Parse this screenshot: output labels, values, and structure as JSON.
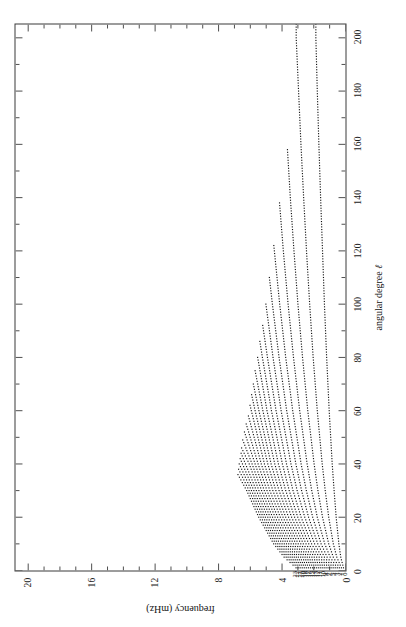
{
  "figure": {
    "kind": "solar-oscillation-ridge-diagram",
    "orientation": "rotated-90-ccw",
    "background": "#ffffff",
    "ink": "#111111"
  },
  "axes": {
    "x": {
      "title": "angular degree",
      "title_symbol": "ℓ",
      "min": 0,
      "max": 205,
      "ticks": [
        0,
        20,
        40,
        60,
        80,
        100,
        120,
        140,
        160,
        180,
        200
      ],
      "tick_labels": [
        "0",
        "20",
        "40",
        "60",
        "80",
        "100",
        "120",
        "140",
        "160",
        "180",
        "200"
      ],
      "minor_step": 10
    },
    "y": {
      "title": "frequency (mHz)",
      "min": 0,
      "max": 20.8,
      "ticks": [
        0,
        4,
        8,
        12,
        16,
        20
      ],
      "tick_labels": [
        "0",
        "4",
        "8",
        "12",
        "16",
        "20"
      ],
      "minor_step": 1
    }
  },
  "chart_data": {
    "type": "line",
    "title": "",
    "subtitle": "",
    "xlabel": "angular degree ℓ",
    "ylabel": "frequency (mHz)",
    "xlim": [
      0,
      205
    ],
    "ylim": [
      0,
      20.8
    ],
    "grid": false,
    "legend": "none",
    "marker": "dotted-points",
    "annotations_note": "each ridge is labelled at its low-ℓ end with its radial order n",
    "ridge_labels": [
      "0",
      "1",
      "2",
      "3",
      "4",
      "5",
      "6",
      "7",
      "8",
      "9",
      "10",
      "11",
      "12",
      "13",
      "14",
      "15",
      "16",
      "17",
      "18",
      "19",
      "20",
      "21",
      "22",
      "23"
    ],
    "series": [
      {
        "name": "0",
        "label": "0",
        "lmax": 205,
        "x": [
          1,
          5,
          10,
          20,
          30,
          40,
          60,
          80,
          100,
          120,
          140,
          160,
          180,
          200
        ],
        "values": [
          0.13,
          0.3,
          0.42,
          0.59,
          0.72,
          0.84,
          1.03,
          1.19,
          1.33,
          1.45,
          1.57,
          1.68,
          1.78,
          1.87
        ]
      },
      {
        "name": "1",
        "label": "1",
        "lmax": 205,
        "x": [
          1,
          5,
          10,
          20,
          30,
          40,
          60,
          80,
          100,
          120,
          140,
          160,
          180,
          200
        ],
        "values": [
          0.26,
          0.55,
          0.77,
          1.06,
          1.28,
          1.47,
          1.78,
          2.04,
          2.26,
          2.46,
          2.64,
          2.81,
          2.96,
          3.11
        ]
      },
      {
        "name": "2",
        "label": "2",
        "lmax": 158,
        "x": [
          1,
          5,
          10,
          20,
          30,
          40,
          60,
          80,
          100,
          120,
          140,
          158
        ],
        "values": [
          0.39,
          0.77,
          1.06,
          1.45,
          1.74,
          1.98,
          2.38,
          2.71,
          3.0,
          3.25,
          3.48,
          3.66
        ]
      },
      {
        "name": "3",
        "label": "3",
        "lmax": 138,
        "x": [
          1,
          5,
          10,
          20,
          30,
          40,
          60,
          80,
          100,
          120,
          138
        ],
        "values": [
          0.52,
          0.97,
          1.31,
          1.78,
          2.13,
          2.42,
          2.89,
          3.28,
          3.62,
          3.92,
          4.16
        ]
      },
      {
        "name": "4",
        "label": "4",
        "lmax": 122,
        "x": [
          1,
          5,
          10,
          20,
          30,
          40,
          60,
          80,
          100,
          122
        ],
        "values": [
          0.65,
          1.16,
          1.54,
          2.07,
          2.47,
          2.8,
          3.33,
          3.77,
          4.15,
          4.52
        ]
      },
      {
        "name": "5",
        "label": "5",
        "lmax": 110,
        "x": [
          1,
          5,
          10,
          20,
          30,
          40,
          60,
          80,
          100,
          110
        ],
        "values": [
          0.78,
          1.33,
          1.75,
          2.33,
          2.77,
          3.13,
          3.71,
          4.19,
          4.61,
          4.8
        ]
      },
      {
        "name": "6",
        "label": "6",
        "lmax": 100,
        "x": [
          1,
          5,
          10,
          20,
          30,
          40,
          60,
          80,
          100
        ],
        "values": [
          0.91,
          1.5,
          1.95,
          2.57,
          3.05,
          3.44,
          4.06,
          4.57,
          5.02
        ]
      },
      {
        "name": "7",
        "label": "7",
        "lmax": 92,
        "x": [
          1,
          5,
          10,
          20,
          30,
          40,
          60,
          80,
          92
        ],
        "values": [
          1.04,
          1.66,
          2.14,
          2.8,
          3.31,
          3.72,
          4.38,
          4.92,
          5.22
        ]
      },
      {
        "name": "8",
        "label": "8",
        "lmax": 86,
        "x": [
          1,
          5,
          10,
          20,
          30,
          40,
          60,
          80,
          86
        ],
        "values": [
          1.17,
          1.82,
          2.32,
          3.01,
          3.55,
          3.98,
          4.67,
          5.24,
          5.4
        ]
      },
      {
        "name": "9",
        "label": "9",
        "lmax": 80,
        "x": [
          1,
          5,
          10,
          20,
          30,
          40,
          60,
          80
        ],
        "values": [
          1.3,
          1.97,
          2.49,
          3.21,
          3.77,
          4.23,
          4.95,
          5.54
        ]
      },
      {
        "name": "10",
        "label": "10",
        "lmax": 75,
        "x": [
          1,
          5,
          10,
          20,
          30,
          40,
          60,
          75
        ],
        "values": [
          1.43,
          2.12,
          2.66,
          3.4,
          3.99,
          4.46,
          5.21,
          5.7
        ]
      },
      {
        "name": "11",
        "label": "11",
        "lmax": 70,
        "x": [
          1,
          5,
          10,
          20,
          30,
          40,
          60,
          70
        ],
        "values": [
          1.56,
          2.27,
          2.82,
          3.59,
          4.19,
          4.69,
          5.46,
          5.81
        ]
      },
      {
        "name": "12",
        "label": "12",
        "lmax": 66,
        "x": [
          1,
          5,
          10,
          20,
          30,
          40,
          60,
          66
        ],
        "values": [
          1.69,
          2.41,
          2.98,
          3.77,
          4.39,
          4.9,
          5.7,
          5.92
        ]
      },
      {
        "name": "13",
        "label": "13",
        "lmax": 62,
        "x": [
          1,
          5,
          10,
          20,
          30,
          40,
          62
        ],
        "values": [
          1.82,
          2.55,
          3.13,
          3.94,
          4.58,
          5.11,
          6.02
        ]
      },
      {
        "name": "14",
        "label": "14",
        "lmax": 58,
        "x": [
          1,
          5,
          10,
          20,
          30,
          40,
          58
        ],
        "values": [
          1.95,
          2.69,
          3.28,
          4.11,
          4.77,
          5.31,
          6.12
        ]
      },
      {
        "name": "15",
        "label": "15",
        "lmax": 55,
        "x": [
          1,
          5,
          10,
          20,
          30,
          40,
          55
        ],
        "values": [
          2.08,
          2.83,
          3.43,
          4.28,
          4.95,
          5.51,
          6.26
        ]
      },
      {
        "name": "16",
        "label": "16",
        "lmax": 52,
        "x": [
          1,
          5,
          10,
          20,
          30,
          40,
          52
        ],
        "values": [
          2.21,
          2.97,
          3.58,
          4.44,
          5.12,
          5.7,
          6.37
        ]
      },
      {
        "name": "17",
        "label": "17",
        "lmax": 49,
        "x": [
          1,
          5,
          10,
          20,
          30,
          40,
          49
        ],
        "values": [
          2.34,
          3.1,
          3.72,
          4.6,
          5.29,
          5.89,
          6.48
        ]
      },
      {
        "name": "18",
        "label": "18",
        "lmax": 46,
        "x": [
          1,
          5,
          10,
          20,
          30,
          40,
          46
        ],
        "values": [
          2.47,
          3.23,
          3.86,
          4.75,
          5.46,
          6.07,
          6.55
        ]
      },
      {
        "name": "19",
        "label": "19",
        "lmax": 44,
        "x": [
          1,
          5,
          10,
          20,
          30,
          44
        ],
        "values": [
          2.6,
          3.36,
          4.0,
          4.9,
          5.62,
          6.58
        ]
      },
      {
        "name": "20",
        "label": "20",
        "lmax": 42,
        "x": [
          1,
          5,
          10,
          20,
          30,
          42
        ],
        "values": [
          2.73,
          3.49,
          4.14,
          5.05,
          5.78,
          6.64
        ]
      },
      {
        "name": "21",
        "label": "21",
        "lmax": 40,
        "x": [
          1,
          5,
          10,
          20,
          30,
          40
        ],
        "values": [
          2.86,
          3.62,
          4.27,
          5.19,
          5.93,
          6.7
        ]
      },
      {
        "name": "22",
        "label": "22",
        "lmax": 38,
        "x": [
          1,
          5,
          10,
          20,
          30,
          38
        ],
        "values": [
          2.99,
          3.74,
          4.4,
          5.33,
          6.08,
          6.74
        ]
      },
      {
        "name": "23",
        "label": "23",
        "lmax": 36,
        "x": [
          1,
          5,
          10,
          20,
          30,
          36
        ],
        "values": [
          3.12,
          3.87,
          4.53,
          5.47,
          6.23,
          6.78
        ]
      }
    ]
  }
}
